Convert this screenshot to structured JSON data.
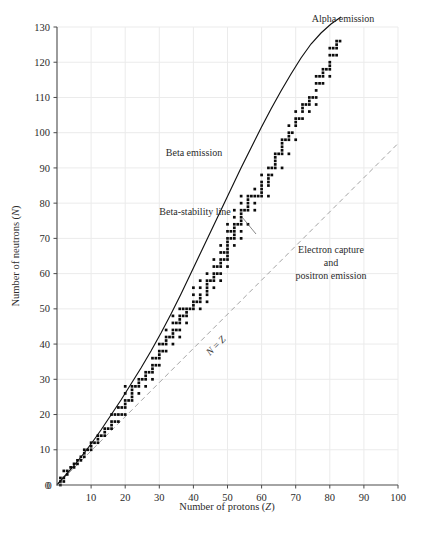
{
  "chart_data": {
    "type": "scatter",
    "title": "",
    "xlabel": "Number of protons (Z)",
    "ylabel": "Number of neutrons (N)",
    "xlim": [
      0,
      100
    ],
    "ylim": [
      0,
      130
    ],
    "xticks": [
      0,
      10,
      20,
      30,
      40,
      50,
      60,
      70,
      80,
      90,
      100
    ],
    "yticks": [
      0,
      10,
      20,
      30,
      40,
      50,
      60,
      70,
      80,
      90,
      100,
      110,
      120,
      130
    ],
    "grid": true,
    "legend_position": "none",
    "series": [
      {
        "name": "Stable nuclides",
        "marker": "square-dot",
        "color": "#0b0b0b",
        "points": [
          [
            1,
            0
          ],
          [
            1,
            1
          ],
          [
            1,
            2
          ],
          [
            2,
            1
          ],
          [
            2,
            2
          ],
          [
            2,
            4
          ],
          [
            3,
            3
          ],
          [
            3,
            4
          ],
          [
            4,
            5
          ],
          [
            5,
            5
          ],
          [
            5,
            6
          ],
          [
            6,
            6
          ],
          [
            6,
            7
          ],
          [
            7,
            7
          ],
          [
            7,
            8
          ],
          [
            8,
            8
          ],
          [
            8,
            9
          ],
          [
            8,
            10
          ],
          [
            9,
            10
          ],
          [
            10,
            10
          ],
          [
            10,
            11
          ],
          [
            10,
            12
          ],
          [
            11,
            12
          ],
          [
            12,
            12
          ],
          [
            12,
            13
          ],
          [
            12,
            14
          ],
          [
            13,
            14
          ],
          [
            14,
            14
          ],
          [
            14,
            15
          ],
          [
            14,
            16
          ],
          [
            15,
            16
          ],
          [
            16,
            16
          ],
          [
            16,
            17
          ],
          [
            16,
            18
          ],
          [
            16,
            20
          ],
          [
            17,
            18
          ],
          [
            17,
            20
          ],
          [
            18,
            18
          ],
          [
            18,
            20
          ],
          [
            18,
            22
          ],
          [
            19,
            20
          ],
          [
            19,
            22
          ],
          [
            20,
            20
          ],
          [
            20,
            22
          ],
          [
            20,
            23
          ],
          [
            20,
            24
          ],
          [
            20,
            26
          ],
          [
            20,
            28
          ],
          [
            21,
            24
          ],
          [
            22,
            24
          ],
          [
            22,
            25
          ],
          [
            22,
            26
          ],
          [
            22,
            27
          ],
          [
            22,
            28
          ],
          [
            23,
            28
          ],
          [
            24,
            26
          ],
          [
            24,
            28
          ],
          [
            24,
            29
          ],
          [
            24,
            30
          ],
          [
            25,
            30
          ],
          [
            26,
            28
          ],
          [
            26,
            30
          ],
          [
            26,
            31
          ],
          [
            26,
            32
          ],
          [
            27,
            32
          ],
          [
            28,
            30
          ],
          [
            28,
            32
          ],
          [
            28,
            33
          ],
          [
            28,
            34
          ],
          [
            28,
            36
          ],
          [
            29,
            34
          ],
          [
            29,
            36
          ],
          [
            30,
            34
          ],
          [
            30,
            36
          ],
          [
            30,
            37
          ],
          [
            30,
            38
          ],
          [
            30,
            40
          ],
          [
            31,
            38
          ],
          [
            31,
            40
          ],
          [
            32,
            38
          ],
          [
            32,
            40
          ],
          [
            32,
            41
          ],
          [
            32,
            42
          ],
          [
            32,
            44
          ],
          [
            33,
            42
          ],
          [
            34,
            40
          ],
          [
            34,
            42
          ],
          [
            34,
            43
          ],
          [
            34,
            44
          ],
          [
            34,
            46
          ],
          [
            34,
            48
          ],
          [
            35,
            44
          ],
          [
            35,
            46
          ],
          [
            36,
            42
          ],
          [
            36,
            44
          ],
          [
            36,
            46
          ],
          [
            36,
            47
          ],
          [
            36,
            48
          ],
          [
            36,
            50
          ],
          [
            37,
            48
          ],
          [
            37,
            50
          ],
          [
            38,
            46
          ],
          [
            38,
            48
          ],
          [
            38,
            49
          ],
          [
            38,
            50
          ],
          [
            39,
            50
          ],
          [
            40,
            50
          ],
          [
            40,
            51
          ],
          [
            40,
            52
          ],
          [
            40,
            54
          ],
          [
            40,
            56
          ],
          [
            41,
            52
          ],
          [
            42,
            50
          ],
          [
            42,
            52
          ],
          [
            42,
            53
          ],
          [
            42,
            54
          ],
          [
            42,
            56
          ],
          [
            42,
            58
          ],
          [
            44,
            52
          ],
          [
            44,
            54
          ],
          [
            44,
            55
          ],
          [
            44,
            56
          ],
          [
            44,
            57
          ],
          [
            44,
            58
          ],
          [
            44,
            60
          ],
          [
            45,
            58
          ],
          [
            46,
            56
          ],
          [
            46,
            58
          ],
          [
            46,
            59
          ],
          [
            46,
            60
          ],
          [
            46,
            62
          ],
          [
            46,
            64
          ],
          [
            47,
            60
          ],
          [
            47,
            62
          ],
          [
            48,
            58
          ],
          [
            48,
            60
          ],
          [
            48,
            62
          ],
          [
            48,
            63
          ],
          [
            48,
            64
          ],
          [
            48,
            66
          ],
          [
            48,
            68
          ],
          [
            49,
            64
          ],
          [
            49,
            66
          ],
          [
            50,
            62
          ],
          [
            50,
            64
          ],
          [
            50,
            65
          ],
          [
            50,
            66
          ],
          [
            50,
            67
          ],
          [
            50,
            68
          ],
          [
            50,
            69
          ],
          [
            50,
            70
          ],
          [
            50,
            72
          ],
          [
            50,
            74
          ],
          [
            51,
            70
          ],
          [
            51,
            72
          ],
          [
            52,
            68
          ],
          [
            52,
            70
          ],
          [
            52,
            71
          ],
          [
            52,
            72
          ],
          [
            52,
            73
          ],
          [
            52,
            74
          ],
          [
            52,
            76
          ],
          [
            52,
            78
          ],
          [
            53,
            74
          ],
          [
            54,
            70
          ],
          [
            54,
            72
          ],
          [
            54,
            74
          ],
          [
            54,
            75
          ],
          [
            54,
            76
          ],
          [
            54,
            77
          ],
          [
            54,
            78
          ],
          [
            54,
            80
          ],
          [
            54,
            82
          ],
          [
            55,
            78
          ],
          [
            56,
            74
          ],
          [
            56,
            78
          ],
          [
            56,
            79
          ],
          [
            56,
            80
          ],
          [
            56,
            81
          ],
          [
            56,
            82
          ],
          [
            57,
            82
          ],
          [
            58,
            78
          ],
          [
            58,
            80
          ],
          [
            58,
            82
          ],
          [
            58,
            84
          ],
          [
            59,
            82
          ],
          [
            60,
            82
          ],
          [
            60,
            83
          ],
          [
            60,
            84
          ],
          [
            60,
            85
          ],
          [
            60,
            86
          ],
          [
            60,
            88
          ],
          [
            62,
            82
          ],
          [
            62,
            85
          ],
          [
            62,
            86
          ],
          [
            62,
            87
          ],
          [
            62,
            88
          ],
          [
            62,
            90
          ],
          [
            63,
            88
          ],
          [
            63,
            90
          ],
          [
            64,
            90
          ],
          [
            64,
            91
          ],
          [
            64,
            92
          ],
          [
            64,
            93
          ],
          [
            64,
            94
          ],
          [
            65,
            94
          ],
          [
            66,
            90
          ],
          [
            66,
            94
          ],
          [
            66,
            95
          ],
          [
            66,
            96
          ],
          [
            66,
            97
          ],
          [
            66,
            98
          ],
          [
            67,
            98
          ],
          [
            68,
            94
          ],
          [
            68,
            98
          ],
          [
            68,
            99
          ],
          [
            68,
            100
          ],
          [
            68,
            102
          ],
          [
            69,
            100
          ],
          [
            70,
            98
          ],
          [
            70,
            102
          ],
          [
            70,
            103
          ],
          [
            70,
            104
          ],
          [
            70,
            106
          ],
          [
            71,
            104
          ],
          [
            72,
            104
          ],
          [
            72,
            106
          ],
          [
            72,
            107
          ],
          [
            72,
            108
          ],
          [
            73,
            108
          ],
          [
            74,
            106
          ],
          [
            74,
            108
          ],
          [
            74,
            109
          ],
          [
            74,
            110
          ],
          [
            75,
            110
          ],
          [
            76,
            108
          ],
          [
            76,
            110
          ],
          [
            76,
            112
          ],
          [
            76,
            114
          ],
          [
            76,
            116
          ],
          [
            77,
            114
          ],
          [
            77,
            116
          ],
          [
            78,
            114
          ],
          [
            78,
            116
          ],
          [
            78,
            117
          ],
          [
            78,
            118
          ],
          [
            79,
            118
          ],
          [
            80,
            116
          ],
          [
            80,
            118
          ],
          [
            80,
            119
          ],
          [
            80,
            120
          ],
          [
            80,
            122
          ],
          [
            80,
            124
          ],
          [
            81,
            122
          ],
          [
            81,
            124
          ],
          [
            82,
            122
          ],
          [
            82,
            124
          ],
          [
            82,
            125
          ],
          [
            82,
            126
          ],
          [
            83,
            126
          ]
        ]
      }
    ],
    "reference_lines": [
      {
        "name": "Beta-stability line",
        "style": "solid",
        "color": "#111111"
      },
      {
        "name": "N = Z",
        "style": "dashed",
        "color": "#9a9a9a",
        "equation": "N = Z"
      }
    ],
    "annotations": [
      {
        "id": "alpha",
        "text": "Alpha emission"
      },
      {
        "id": "beta",
        "text": "Beta emission"
      },
      {
        "id": "stab",
        "text": "Beta-stability line"
      },
      {
        "id": "ec1",
        "text": "Electron capture"
      },
      {
        "id": "ec2",
        "text": "and"
      },
      {
        "id": "ec3",
        "text": "positron emission"
      },
      {
        "id": "nz",
        "text": "N = Z"
      }
    ]
  },
  "axes": {
    "x": {
      "title_prefix": "Number of protons (",
      "title_var": "Z",
      "title_suffix": ")",
      "labels": [
        "0",
        "10",
        "20",
        "30",
        "40",
        "50",
        "60",
        "70",
        "80",
        "90",
        "100"
      ]
    },
    "y": {
      "title_prefix": "Number of neutrons (",
      "title_var": "N",
      "title_suffix": ")",
      "labels": [
        "0",
        "10",
        "20",
        "30",
        "40",
        "50",
        "60",
        "70",
        "80",
        "90",
        "100",
        "110",
        "120",
        "130"
      ]
    }
  },
  "annotation_text": {
    "alpha_emission": "Alpha emission",
    "beta_emission": "Beta emission",
    "beta_stability_line": "Beta-stability line",
    "electron_capture": "Electron capture",
    "and": "and",
    "positron_emission": "positron emission",
    "nz_var_n": "N",
    "nz_equals": " = ",
    "nz_var_z": "Z"
  },
  "colors": {
    "point": "#0b0b0b",
    "grid": "#ebebeb",
    "axis": "#4a4a4a",
    "stability_line": "#111111",
    "nz_line": "#9a9a9a",
    "background": "#ffffff"
  }
}
